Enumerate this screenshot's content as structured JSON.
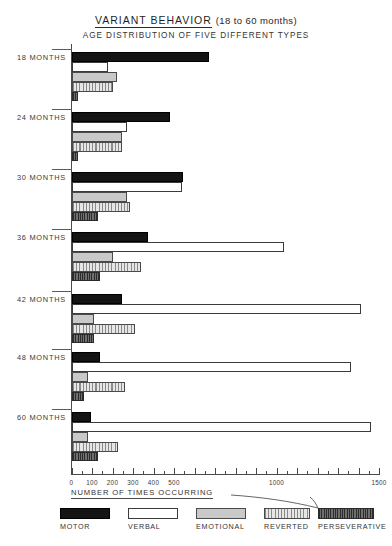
{
  "titles": {
    "main_left": "VARIANT  BEHAVIOR",
    "main_right": "(18 to 60  months)",
    "subtitle": "AGE  DISTRIBUTION  OF  FIVE  DIFFERENT   TYPES"
  },
  "axis": {
    "caption": "NUMBER  OF  TIMES  OCCURRING",
    "labels": [
      "0",
      "100",
      "200",
      "300",
      "400",
      "500",
      "1000",
      "1500"
    ],
    "label_values": [
      0,
      100,
      200,
      300,
      400,
      500,
      1000,
      1500
    ],
    "min": 0,
    "max": 1500,
    "minor_step": 50
  },
  "legend": {
    "items": [
      {
        "label": "MOTOR",
        "pattern": "solid-black",
        "color": "#141414"
      },
      {
        "label": "VERBAL",
        "pattern": "open-white",
        "color": "#ffffff"
      },
      {
        "label": "EMOTIONAL",
        "pattern": "fine-dots",
        "color": "#c9c9c9"
      },
      {
        "label": "REVERTED",
        "pattern": "vertical-stripes",
        "color": "#d4d4d4"
      },
      {
        "label": "PERSEVERATIVE",
        "pattern": "dark-mottled",
        "color": "#4d4d4d"
      }
    ]
  },
  "groups": [
    {
      "label": "18 MONTHS"
    },
    {
      "label": "24 MONTHS"
    },
    {
      "label": "30 MONTHS"
    },
    {
      "label": "36 MONTHS"
    },
    {
      "label": "42 MONTHS"
    },
    {
      "label": "48 MONTHS"
    },
    {
      "label": "60 MONTHS"
    }
  ],
  "chart_data": {
    "type": "bar",
    "orientation": "horizontal",
    "title": "VARIANT BEHAVIOR (18 to 60 months)",
    "subtitle": "AGE DISTRIBUTION OF FIVE DIFFERENT TYPES",
    "xlabel": "NUMBER OF TIMES OCCURRING",
    "ylabel": "",
    "xlim": [
      0,
      1500
    ],
    "grid": false,
    "legend_position": "bottom",
    "categories": [
      "18 MONTHS",
      "24 MONTHS",
      "30 MONTHS",
      "36 MONTHS",
      "42 MONTHS",
      "48 MONTHS",
      "60 MONTHS"
    ],
    "series": [
      {
        "name": "MOTOR",
        "values": [
          670,
          480,
          545,
          375,
          245,
          140,
          95
        ]
      },
      {
        "name": "VERBAL",
        "values": [
          180,
          270,
          540,
          1035,
          1410,
          1365,
          1460
        ]
      },
      {
        "name": "EMOTIONAL",
        "values": [
          220,
          245,
          270,
          200,
          110,
          80,
          80
        ]
      },
      {
        "name": "REVERTED",
        "values": [
          200,
          245,
          285,
          340,
          310,
          260,
          225
        ]
      },
      {
        "name": "PERSEVERATIVE",
        "values": [
          30,
          30,
          130,
          140,
          110,
          60,
          130
        ]
      }
    ]
  }
}
